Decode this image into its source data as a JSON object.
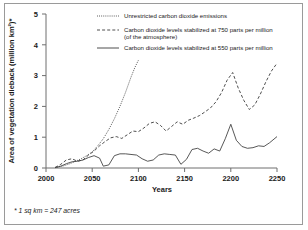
{
  "figure": {
    "footnote": "* 1 sq km = 247 acres"
  },
  "chart_data": {
    "type": "line",
    "title": "",
    "xlabel": "Years",
    "ylabel": "Area of vegetation dieback (million km²)*",
    "xlim": [
      2000,
      2250
    ],
    "ylim": [
      0,
      5
    ],
    "xticks": [
      2000,
      2050,
      2100,
      2150,
      2200,
      2250
    ],
    "xtick_labels": [
      "2000",
      "2050",
      "2100",
      "2150",
      "2200",
      "2250"
    ],
    "yticks": [
      0,
      1,
      2,
      3,
      4,
      5
    ],
    "ytick_labels": [
      "0",
      "1",
      "2",
      "3",
      "4",
      "5"
    ],
    "grid": false,
    "legend_position": "top-center",
    "series": [
      {
        "name": "Unrestricted carbon dioxide emissions",
        "style": "dotted",
        "color": "#3a3a3a",
        "x": [
          2010,
          2018,
          2026,
          2032,
          2038,
          2044,
          2050,
          2056,
          2062,
          2068,
          2074,
          2080,
          2086,
          2092,
          2096,
          2100
        ],
        "y": [
          0.02,
          0.06,
          0.14,
          0.22,
          0.3,
          0.4,
          0.52,
          0.72,
          0.95,
          1.25,
          1.6,
          2.0,
          2.45,
          2.95,
          3.25,
          3.5
        ]
      },
      {
        "name": "Carbon dioxide levels stabilized at 750 parts per million (of the atmosphere)",
        "style": "dashed",
        "color": "#3a3a3a",
        "x": [
          2010,
          2016,
          2022,
          2028,
          2034,
          2040,
          2046,
          2052,
          2058,
          2064,
          2070,
          2076,
          2082,
          2088,
          2094,
          2100,
          2106,
          2112,
          2118,
          2124,
          2130,
          2136,
          2142,
          2148,
          2154,
          2160,
          2166,
          2172,
          2178,
          2184,
          2190,
          2196,
          2202,
          2208,
          2214,
          2220,
          2226,
          2232,
          2238,
          2244,
          2250
        ],
        "y": [
          0.02,
          0.12,
          0.26,
          0.3,
          0.22,
          0.26,
          0.42,
          0.55,
          0.72,
          0.86,
          0.98,
          1.02,
          0.96,
          1.08,
          1.2,
          1.18,
          1.3,
          1.45,
          1.5,
          1.38,
          1.2,
          1.35,
          1.5,
          1.42,
          1.55,
          1.62,
          1.7,
          1.82,
          1.95,
          2.15,
          2.45,
          2.85,
          3.1,
          2.6,
          2.2,
          1.9,
          2.05,
          2.4,
          2.8,
          3.15,
          3.4
        ]
      },
      {
        "name": "Carbon dioxide levels stabilized at 550 parts per million",
        "style": "solid",
        "color": "#3a3a3a",
        "x": [
          2010,
          2016,
          2022,
          2028,
          2034,
          2040,
          2046,
          2052,
          2058,
          2062,
          2068,
          2074,
          2080,
          2086,
          2092,
          2098,
          2104,
          2110,
          2116,
          2122,
          2128,
          2134,
          2140,
          2146,
          2152,
          2158,
          2164,
          2170,
          2176,
          2182,
          2188,
          2194,
          2200,
          2206,
          2212,
          2218,
          2224,
          2230,
          2236,
          2242,
          2250
        ],
        "y": [
          0.01,
          0.06,
          0.14,
          0.2,
          0.22,
          0.26,
          0.34,
          0.4,
          0.32,
          0.06,
          0.1,
          0.4,
          0.46,
          0.46,
          0.44,
          0.42,
          0.3,
          0.22,
          0.26,
          0.42,
          0.46,
          0.44,
          0.42,
          0.12,
          0.28,
          0.6,
          0.64,
          0.55,
          0.48,
          0.62,
          0.55,
          0.95,
          1.42,
          0.9,
          0.7,
          0.64,
          0.66,
          0.72,
          0.7,
          0.82,
          1.02
        ]
      }
    ]
  }
}
